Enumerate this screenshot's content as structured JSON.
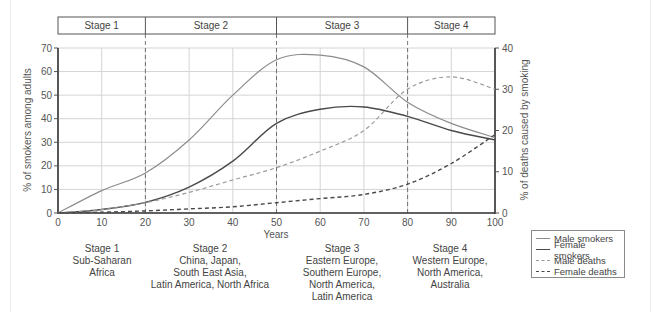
{
  "chart_data": {
    "type": "line",
    "title": "",
    "xlabel": "Years",
    "ylabel": "% of smokers among adults",
    "ylabel_right": "% of deaths caused by smoking",
    "xlim": [
      0,
      100
    ],
    "ylim": [
      0,
      70
    ],
    "ylim_right": [
      0,
      40
    ],
    "x_ticks": [
      "0",
      "10",
      "20",
      "30",
      "40",
      "50",
      "60",
      "70",
      "80",
      "90",
      "100"
    ],
    "y_ticks": [
      "0",
      "10",
      "20",
      "30",
      "40",
      "50",
      "60",
      "70"
    ],
    "y_ticks_right": [
      "0",
      "10",
      "20",
      "30",
      "40"
    ],
    "grid": true,
    "legend_position": "bottom-right",
    "stages": [
      {
        "label": "Stage 1",
        "x_start": 0,
        "x_end": 20
      },
      {
        "label": "Stage 2",
        "x_start": 20,
        "x_end": 50
      },
      {
        "label": "Stage 3",
        "x_start": 50,
        "x_end": 80
      },
      {
        "label": "Stage 4",
        "x_start": 80,
        "x_end": 100
      }
    ],
    "x": [
      0,
      10,
      20,
      30,
      40,
      50,
      60,
      70,
      80,
      90,
      100
    ],
    "series": [
      {
        "name": "Male smokers",
        "axis": "left",
        "style": "solid",
        "color": "#8c8c8c",
        "values": [
          0,
          9.5,
          17,
          31,
          50,
          65,
          67,
          62,
          47,
          38,
          32
        ]
      },
      {
        "name": "Female smokers",
        "axis": "left",
        "style": "solid",
        "color": "#4a4a4a",
        "values": [
          0,
          1.5,
          4.5,
          11,
          22,
          38,
          44,
          45,
          41,
          35,
          31
        ]
      },
      {
        "name": "Male deaths",
        "axis": "right",
        "style": "dashed",
        "color": "#9a9a9a",
        "values": [
          0,
          0.8,
          2.5,
          5,
          8,
          11,
          15,
          20,
          30,
          33,
          30
        ]
      },
      {
        "name": "Female deaths",
        "axis": "right",
        "style": "dashed",
        "color": "#4a4a4a",
        "values": [
          0,
          0.2,
          0.5,
          1,
          1.5,
          2.5,
          3.5,
          4.5,
          7,
          12,
          19
        ]
      }
    ]
  },
  "regions": [
    {
      "lines": [
        "Stage 1",
        "Sub-Saharan",
        "Africa"
      ]
    },
    {
      "lines": [
        "Stage 2",
        "China, Japan,",
        "South East Asia,",
        "Latin America, North Africa"
      ]
    },
    {
      "lines": [
        "Stage 3",
        "Eastern Europe,",
        "Southern Europe,",
        "North America,",
        "Latin America"
      ]
    },
    {
      "lines": [
        "Stage 4",
        "Western Europe,",
        "North America,",
        "Australia"
      ]
    }
  ],
  "legend": [
    {
      "label": "Male smokers"
    },
    {
      "label": "Female smokers"
    },
    {
      "label": "Male deaths"
    },
    {
      "label": "Female deaths"
    }
  ]
}
